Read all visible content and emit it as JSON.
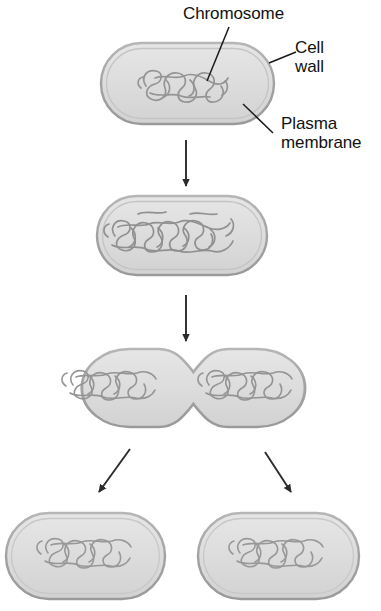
{
  "diagram": {
    "background_color": "#ffffff",
    "labels": {
      "chromosome": "Chromosome",
      "cell_wall": "Cell\nwall",
      "plasma_membrane": "Plasma\nmembrane"
    },
    "colors": {
      "cell_fill": "#dedede",
      "cell_fill_light": "#e8e8e8",
      "cell_border": "#9a9a9a",
      "chromosome_stroke": "#8f8f8f",
      "arrow": "#2b2b2b",
      "leader_line": "#1a1a1a",
      "text": "#111111"
    },
    "stages": [
      {
        "name": "parent-cell",
        "caption": "Parent cell with single chromosome",
        "cell_count": 1,
        "chromosome_count": 1
      },
      {
        "name": "replicated-cell",
        "caption": "Chromosome replicated, cell elongating",
        "cell_count": 1,
        "chromosome_count": 2
      },
      {
        "name": "dividing-cell",
        "caption": "Cell constricting, chromosomes separated",
        "cell_count": 1,
        "chromosome_count": 2
      },
      {
        "name": "daughter-cells",
        "caption": "Two identical daughter cells",
        "cell_count": 2,
        "chromosome_count": 2
      }
    ],
    "arrows": [
      {
        "name": "arrow-stage1-to-stage2",
        "direction": "down"
      },
      {
        "name": "arrow-stage2-to-stage3",
        "direction": "down"
      },
      {
        "name": "arrow-stage3-to-daughter-left",
        "direction": "down-left"
      },
      {
        "name": "arrow-stage3-to-daughter-right",
        "direction": "down-right"
      }
    ],
    "leader_lines": [
      {
        "name": "leader-chromosome",
        "target": "chromosome"
      },
      {
        "name": "leader-cell-wall",
        "target": "cell wall"
      },
      {
        "name": "leader-plasma-membrane",
        "target": "plasma membrane"
      }
    ]
  }
}
